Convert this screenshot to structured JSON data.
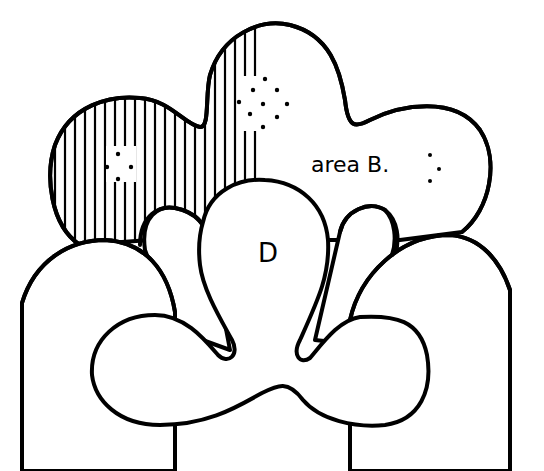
{
  "diagram": {
    "labels": {
      "area_b": "area B.",
      "d": "D"
    },
    "shapes": [
      {
        "name": "upper-cloud",
        "description": "large cloud shape with two lobes; left portion hatched with vertical lines"
      },
      {
        "name": "left-arc",
        "description": "semicircular arc on left"
      },
      {
        "name": "right-arc",
        "description": "semicircular arc on right"
      },
      {
        "name": "left-finger",
        "description": "lobe between left arc and D"
      },
      {
        "name": "right-finger",
        "description": "lobe between D and right arc"
      },
      {
        "name": "center-bulb-d",
        "description": "central bulb labeled D"
      },
      {
        "name": "bottom-blob",
        "description": "wide two-lobed shape at bottom"
      }
    ],
    "colors": {
      "stroke": "#000000",
      "background": "#ffffff"
    }
  }
}
